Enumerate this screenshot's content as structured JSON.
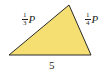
{
  "diagram": {
    "shape": "triangle",
    "fill_color": "#f6df72",
    "stroke_color": "#2a2a2a",
    "vertices": [
      [
        9,
        55
      ],
      [
        69,
        5
      ],
      [
        91,
        55
      ]
    ],
    "sides": {
      "left": {
        "num": "1",
        "den": "3",
        "var": "P"
      },
      "right": {
        "num": "1",
        "den": "4",
        "var": "P"
      },
      "bottom": {
        "label": "5"
      }
    }
  }
}
